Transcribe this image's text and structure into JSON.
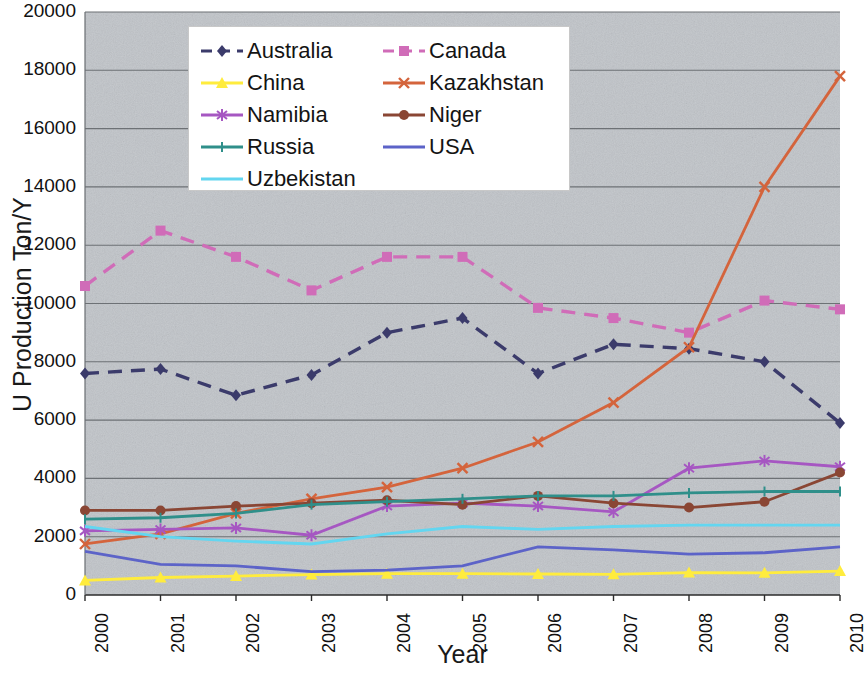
{
  "chart_data": {
    "type": "line",
    "title": "",
    "xlabel": "Year",
    "ylabel": "U Production Ton/Y",
    "x": [
      2000,
      2001,
      2002,
      2003,
      2004,
      2005,
      2006,
      2007,
      2008,
      2009,
      2010
    ],
    "xtick_labels": [
      "2000",
      "2001",
      "2002",
      "2003",
      "2004",
      "2005",
      "2006",
      "2007",
      "2008",
      "2009",
      "2010"
    ],
    "ytick_labels": [
      "0",
      "2000",
      "4000",
      "6000",
      "8000",
      "10000",
      "12000",
      "14000",
      "16000",
      "18000",
      "20000"
    ],
    "ylim": [
      0,
      20000
    ],
    "ytick_step": 2000,
    "xlim": [
      2000,
      2010
    ],
    "grid": "horizontal",
    "legend_position": "top-center",
    "plot_background": "#c9cdd1",
    "series": [
      {
        "name": "Australia",
        "color": "#3b3b6b",
        "dash": "dashed",
        "marker": "diamond",
        "values": [
          7600,
          7750,
          6850,
          7550,
          9000,
          9500,
          7600,
          8600,
          8450,
          8000,
          5900
        ]
      },
      {
        "name": "Canada",
        "color": "#d06cb8",
        "dash": "dashed",
        "marker": "square",
        "values": [
          10600,
          12500,
          11600,
          10450,
          11600,
          11600,
          9850,
          9500,
          9000,
          10100,
          9800
        ]
      },
      {
        "name": "China",
        "color": "#ffec3d",
        "dash": "solid",
        "marker": "triangle",
        "values": [
          500,
          600,
          650,
          700,
          730,
          730,
          720,
          710,
          770,
          760,
          820
        ]
      },
      {
        "name": "Kazakhstan",
        "color": "#d4643c",
        "dash": "solid",
        "marker": "cross",
        "values": [
          1750,
          2100,
          2800,
          3300,
          3700,
          4350,
          5250,
          6600,
          8500,
          14000,
          17800
        ]
      },
      {
        "name": "Namibia",
        "color": "#a657c2",
        "dash": "solid",
        "marker": "asterisk",
        "values": [
          2200,
          2250,
          2300,
          2050,
          3050,
          3150,
          3050,
          2850,
          4350,
          4600,
          4400
        ]
      },
      {
        "name": "Niger",
        "color": "#8a4634",
        "dash": "solid",
        "marker": "circle",
        "values": [
          2900,
          2900,
          3050,
          3150,
          3250,
          3100,
          3400,
          3150,
          3000,
          3200,
          4200
        ]
      },
      {
        "name": "Russia",
        "color": "#2f8f8a",
        "dash": "solid",
        "marker": "bar",
        "values": [
          2600,
          2650,
          2800,
          3100,
          3200,
          3300,
          3400,
          3400,
          3500,
          3550,
          3550
        ]
      },
      {
        "name": "USA",
        "color": "#5c63c8",
        "dash": "solid",
        "marker": "none",
        "values": [
          1500,
          1050,
          1000,
          800,
          850,
          1000,
          1650,
          1550,
          1400,
          1450,
          1650
        ]
      },
      {
        "name": "Uzbekistan",
        "color": "#63d6f0",
        "dash": "solid",
        "marker": "none",
        "values": [
          2350,
          2000,
          1850,
          1750,
          2100,
          2350,
          2250,
          2350,
          2400,
          2400,
          2400
        ]
      }
    ]
  },
  "legend": {
    "items": [
      {
        "label": "Australia"
      },
      {
        "label": "Canada"
      },
      {
        "label": "China"
      },
      {
        "label": "Kazakhstan"
      },
      {
        "label": "Namibia"
      },
      {
        "label": "Niger"
      },
      {
        "label": "Russia"
      },
      {
        "label": "USA"
      },
      {
        "label": "Uzbekistan"
      }
    ]
  }
}
